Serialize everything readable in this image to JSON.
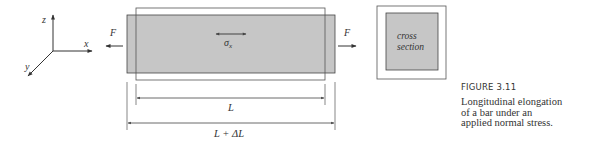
{
  "axes": {
    "x_label": "x",
    "y_label": "y",
    "z_label": "z"
  },
  "forces": {
    "left_label": "F",
    "right_label": "F"
  },
  "bar": {
    "stress_label": "σ",
    "stress_subscript": "x"
  },
  "cross_section": {
    "line1": "cross",
    "line2": "section"
  },
  "dimensions": {
    "original_length": "L",
    "elongated_length": "L + ΔL"
  },
  "caption": {
    "label": "FIGURE 3.11",
    "lines": [
      "Longitudinal elongation",
      "of a bar under an",
      "applied normal stress."
    ]
  },
  "colors": {
    "bar_fill": "#c6c6c6",
    "stroke": "#333333",
    "outline": "#555555",
    "background": "#ffffff"
  }
}
